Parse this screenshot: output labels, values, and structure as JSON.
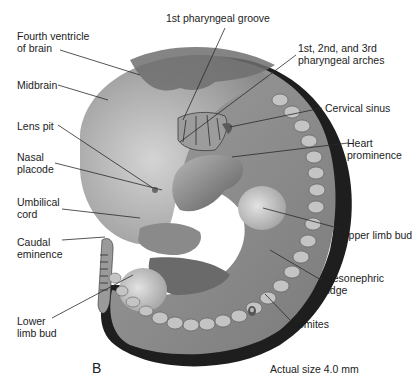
{
  "figure": {
    "panel_letter": "B",
    "size_note": {
      "icon": "embryo-size-icon",
      "text": "Actual size 4.0 mm"
    },
    "colors": {
      "body_outline": "#1a1a1a",
      "body_mid": "#8a8a8a",
      "body_light": "#c8c8c8",
      "brain_dark": "#6e6e6e",
      "leader_line": "#2a2a2a",
      "text": "#1c1c1c",
      "background": "#ffffff"
    }
  },
  "labels": [
    {
      "id": "fourth-ventricle",
      "text": "Fourth ventricle\nof brain"
    },
    {
      "id": "midbrain",
      "text": "Midbrain"
    },
    {
      "id": "lens-pit",
      "text": "Lens pit"
    },
    {
      "id": "nasal-placode",
      "text": "Nasal\nplacode"
    },
    {
      "id": "umbilical-cord",
      "text": "Umbilical\ncord"
    },
    {
      "id": "caudal-eminence",
      "text": "Caudal\neminence"
    },
    {
      "id": "lower-limb-bud",
      "text": "Lower\nlimb bud"
    },
    {
      "id": "first-pharyngeal-groove",
      "text": "1st pharyngeal groove"
    },
    {
      "id": "pharyngeal-arches",
      "text": "1st, 2nd, and 3rd\npharyngeal arches"
    },
    {
      "id": "cervical-sinus",
      "text": "Cervical sinus"
    },
    {
      "id": "heart-prominence",
      "text": "Heart\nprominence"
    },
    {
      "id": "upper-limb-bud",
      "text": "Upper limb bud"
    },
    {
      "id": "mesonephric-ridge",
      "text": "Mesonephric\nridge"
    },
    {
      "id": "somites",
      "text": "Somites"
    }
  ]
}
